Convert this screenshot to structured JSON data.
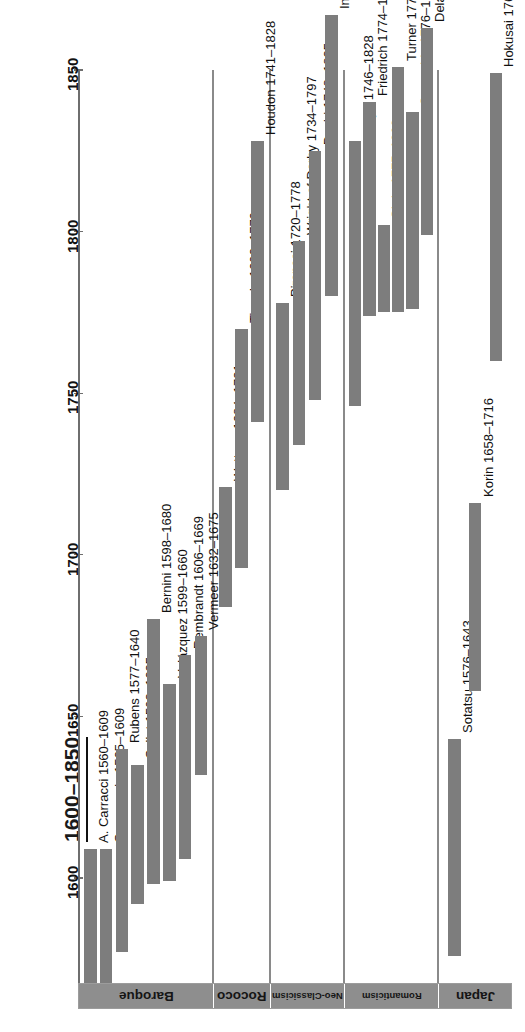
{
  "header": {
    "title": "1600–1850"
  },
  "colors": {
    "bar_fill": "#7d7d7d",
    "axis": "#6e6e6e",
    "group_band": "#8e8e8e",
    "background": "#ffffff",
    "text": "#111111"
  },
  "axis": {
    "orientation": "vertical-rotated",
    "ticks": [
      {
        "label": "1600",
        "value": 1600
      },
      {
        "label": "1650",
        "value": 1650
      },
      {
        "label": "1700",
        "value": 1700
      },
      {
        "label": "1750",
        "value": 1750
      },
      {
        "label": "1800",
        "value": 1800
      },
      {
        "label": "1850",
        "value": 1850
      }
    ]
  },
  "groups": [
    {
      "label": "Baroque",
      "count": 7
    },
    {
      "label": "Rococo",
      "count": 3
    },
    {
      "label": "Neo-Classicism",
      "count": 4
    },
    {
      "label": "Romanticism",
      "count": 6
    },
    {
      "label": "Japan",
      "count": 3
    }
  ],
  "chart_data": {
    "type": "bar",
    "subtype": "gantt-timeline",
    "title": "1600–1850",
    "xlabel": "",
    "ylabel": "",
    "ylim": [
      1540,
      1870
    ],
    "grid": false,
    "legend": "none",
    "axis_ticks": [
      1600,
      1650,
      1700,
      1750,
      1800,
      1850
    ],
    "note": "Each bar spans an artist's lifetime (birth–death). Chart is rotated 180°; years increase upward.",
    "groups": [
      "Baroque",
      "Rococo",
      "Neo-Classicism",
      "Romanticism",
      "Japan"
    ],
    "bars": [
      {
        "group": "Baroque",
        "label": "A. Carracci 1560–1609",
        "name": "A. Carracci",
        "start": 1560,
        "end": 1609
      },
      {
        "group": "Baroque",
        "label": "Caravaggio 1565–1609",
        "name": "Caravaggio",
        "start": 1565,
        "end": 1609
      },
      {
        "group": "Baroque",
        "label": "Rubens 1577–1640",
        "name": "Rubens",
        "start": 1577,
        "end": 1640
      },
      {
        "group": "Baroque",
        "label": "Callot 1592–1635",
        "name": "Callot",
        "start": 1592,
        "end": 1635
      },
      {
        "group": "Baroque",
        "label": "Bernini 1598–1680",
        "name": "Bernini",
        "start": 1598,
        "end": 1680
      },
      {
        "group": "Baroque",
        "label": "Velázquez 1599–1660",
        "name": "Velázquez",
        "start": 1599,
        "end": 1660
      },
      {
        "group": "Baroque",
        "label": "Rembrandt 1606–1669",
        "name": "Rembrandt",
        "start": 1606,
        "end": 1669
      },
      {
        "group": "Baroque",
        "label": "Vermeer 1632–1675",
        "name": "Vermeer",
        "start": 1632,
        "end": 1675
      },
      {
        "group": "Rococo",
        "label": "Watteau 1684–1721",
        "name": "Watteau",
        "start": 1684,
        "end": 1721
      },
      {
        "group": "Rococo",
        "label": "Tiepolo 1696–1770",
        "name": "Tiepolo",
        "start": 1696,
        "end": 1770
      },
      {
        "group": "Rococo",
        "label": "Houdon 1741–1828",
        "name": "Houdon",
        "start": 1741,
        "end": 1828
      },
      {
        "group": "Neo-Classicism",
        "label": "Piranesi 1720–1778",
        "name": "Piranesi",
        "start": 1720,
        "end": 1778
      },
      {
        "group": "Neo-Classicism",
        "label": "Wright of Derby 1734–1797",
        "name": "Wright of Derby",
        "start": 1734,
        "end": 1797
      },
      {
        "group": "Neo-Classicism",
        "label": "David 1748–1825",
        "name": "David",
        "start": 1748,
        "end": 1825
      },
      {
        "group": "Neo-Classicism",
        "label": "Ingres 1780–1867",
        "name": "Ingres",
        "start": 1780,
        "end": 1867
      },
      {
        "group": "Romanticism",
        "label": "Goya 1746–1828",
        "name": "Goya",
        "start": 1746,
        "end": 1828
      },
      {
        "group": "Romanticism",
        "label": "Friedrich 1774–1840",
        "name": "Friedrich",
        "start": 1774,
        "end": 1840
      },
      {
        "group": "Romanticism",
        "label": "Girtin 1775–1802",
        "name": "Girtin",
        "start": 1775,
        "end": 1802
      },
      {
        "group": "Romanticism",
        "label": "Turner 1775–1851",
        "name": "Turner",
        "start": 1775,
        "end": 1851
      },
      {
        "group": "Romanticism",
        "label": "Constable 1776–1837",
        "name": "Constable",
        "start": 1776,
        "end": 1837
      },
      {
        "group": "Romanticism",
        "label": "Delacroix 1799–1863",
        "name": "Delacroix",
        "start": 1799,
        "end": 1863
      },
      {
        "group": "Japan",
        "label": "Sotatsu 1576–1643",
        "name": "Sotatsu",
        "start": 1576,
        "end": 1643
      },
      {
        "group": "Japan",
        "label": "Korin 1658–1716",
        "name": "Korin",
        "start": 1658,
        "end": 1716
      },
      {
        "group": "Japan",
        "label": "Hokusai 1760–1849",
        "name": "Hokusai",
        "start": 1760,
        "end": 1849
      }
    ]
  }
}
